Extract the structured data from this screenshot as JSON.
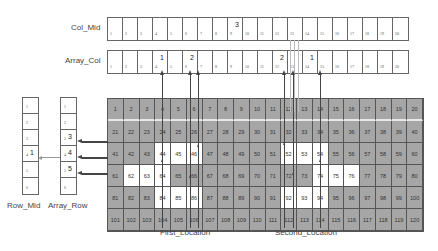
{
  "labels": {
    "col_mid": "Col_Mid",
    "array_col": "Array_Col",
    "row_mid": "Row_Mid",
    "array_row": "Array_Row",
    "first_location": "First_Location",
    "second_location": "Second_Location"
  },
  "col_mid": {
    "cells": [
      "1",
      "2",
      "3",
      "4",
      "5",
      "6",
      "7",
      "8",
      "9",
      "10",
      "11",
      "12",
      "13",
      "14",
      "15",
      "16",
      "17",
      "18",
      "19",
      "20"
    ],
    "superscripts": {
      "8": "3"
    }
  },
  "array_col": {
    "cells": [
      "1",
      "2",
      "3",
      "4",
      "5",
      "6",
      "7",
      "8",
      "9",
      "10",
      "11",
      "12",
      "13",
      "14",
      "15",
      "16",
      "17",
      "18",
      "19",
      "20"
    ],
    "superscripts": {
      "3": "1",
      "5": "2",
      "11": "2",
      "13": "1"
    }
  },
  "row_mid": {
    "cells": [
      "1",
      "2",
      "3",
      "4",
      "5",
      "6"
    ],
    "superscripts": {
      "3": "1"
    }
  },
  "array_row": {
    "cells": [
      "1",
      "2",
      "3",
      "4",
      "5",
      "6"
    ],
    "superscripts": {
      "2": "3",
      "3": "4",
      "4": "5"
    }
  },
  "grid": {
    "rows": 6,
    "cols": 20,
    "highlighted": [
      44,
      45,
      46,
      52,
      53,
      54,
      62,
      63,
      64,
      74,
      75,
      76,
      84,
      85,
      86,
      92,
      93,
      94
    ],
    "colors": {
      "cell": "#a6a6a6",
      "highlight": "#ffffff",
      "border": "#555555"
    }
  }
}
